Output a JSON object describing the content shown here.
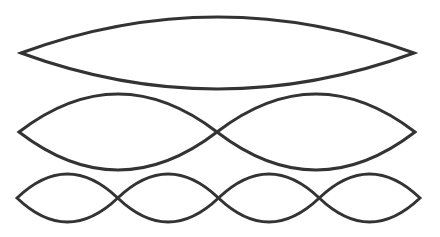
{
  "diagram": {
    "stroke_color": "#333333",
    "stroke_width": 3,
    "background": "#ffffff",
    "rows": [
      {
        "name": "mode-1",
        "loops": 1,
        "x_start": 21,
        "x_end": 414,
        "center_y": 53,
        "amplitude": 36
      },
      {
        "name": "mode-2",
        "loops": 2,
        "x_start": 19,
        "x_end": 415,
        "center_y": 132,
        "amplitude": 38
      },
      {
        "name": "mode-4",
        "loops": 4,
        "x_start": 17,
        "x_end": 420,
        "center_y": 198,
        "amplitude": 24
      }
    ]
  }
}
